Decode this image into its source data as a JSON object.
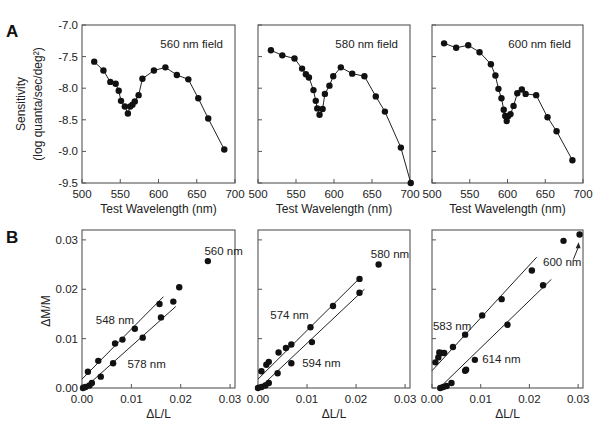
{
  "figure": {
    "panel_letters": [
      "A",
      "B"
    ],
    "row_a": {
      "ylabel_line1": "Sensitivity",
      "ylabel_line2": "(log  quanta/sec/deg²)",
      "xlabel": "Test Wavelength (nm)"
    },
    "row_b": {
      "ylabel": "ΔM/M",
      "xlabel": "ΔL/L"
    }
  },
  "chart_data": [
    {
      "type": "line",
      "panel": "A",
      "title": "560 nm field",
      "xlabel": "Test Wavelength (nm)",
      "ylabel": "Sensitivity (log quanta/sec/deg²)",
      "xlim": [
        500,
        700
      ],
      "ylim": [
        -9.5,
        -7.0
      ],
      "xticks": [
        500,
        550,
        600,
        650,
        700
      ],
      "yticks": [
        -7.0,
        -7.5,
        -8.0,
        -8.5,
        -9.0,
        -9.5
      ],
      "ytick_labels": [
        "-7.0",
        "-7.5",
        "-8.0",
        "-8.5",
        "-9.0",
        "-9.5"
      ],
      "x": [
        516,
        528,
        537,
        544,
        548,
        551,
        556,
        560,
        563,
        566,
        569,
        574,
        579,
        594,
        609,
        624,
        639,
        652,
        665,
        686
      ],
      "y": [
        -7.58,
        -7.72,
        -7.9,
        -7.93,
        -8.04,
        -8.2,
        -8.29,
        -8.4,
        -8.29,
        -8.26,
        -8.21,
        -8.11,
        -7.85,
        -7.72,
        -7.67,
        -7.79,
        -7.86,
        -8.16,
        -8.48,
        -8.97
      ]
    },
    {
      "type": "line",
      "panel": "A",
      "title": "580 nm field",
      "xlabel": "Test Wavelength (nm)",
      "xlim": [
        500,
        700
      ],
      "ylim": [
        -9.5,
        -7.0
      ],
      "xticks": [
        500,
        550,
        600,
        650,
        700
      ],
      "x": [
        517,
        532,
        548,
        558,
        563,
        567,
        573,
        576,
        578,
        581,
        585,
        588,
        594,
        599,
        609,
        624,
        640,
        655,
        667,
        688,
        701
      ],
      "y": [
        -7.4,
        -7.48,
        -7.53,
        -7.69,
        -7.78,
        -7.83,
        -8.03,
        -8.2,
        -8.32,
        -8.42,
        -8.33,
        -8.09,
        -7.96,
        -7.81,
        -7.67,
        -7.77,
        -7.81,
        -8.13,
        -8.37,
        -8.94,
        -9.5
      ]
    },
    {
      "type": "line",
      "panel": "A",
      "title": "600 nm field",
      "xlabel": "Test Wavelength (nm)",
      "xlim": [
        500,
        700
      ],
      "ylim": [
        -9.5,
        -7.0
      ],
      "xticks": [
        500,
        550,
        600,
        650,
        700
      ],
      "x": [
        516,
        532,
        548,
        563,
        578,
        584,
        588,
        592,
        595,
        597,
        599,
        601,
        604,
        608,
        613,
        619,
        624,
        638,
        653,
        665,
        686
      ],
      "y": [
        -7.29,
        -7.36,
        -7.32,
        -7.43,
        -7.62,
        -7.8,
        -8.01,
        -8.16,
        -8.34,
        -8.44,
        -8.52,
        -8.44,
        -8.41,
        -8.28,
        -8.08,
        -8.02,
        -8.09,
        -8.11,
        -8.46,
        -8.68,
        -9.14
      ]
    },
    {
      "type": "scatter",
      "panel": "B",
      "xlabel": "ΔL/L",
      "ylabel": "ΔM/M",
      "xlim": [
        0.0,
        0.031
      ],
      "ylim": [
        0.0,
        0.032
      ],
      "xticks": [
        0.0,
        0.01,
        0.02,
        0.03
      ],
      "yticks": [
        0.0,
        0.01,
        0.02,
        0.03
      ],
      "series": [
        {
          "name": "548 nm",
          "x": [
            0.0012,
            0.0033,
            0.0067,
            0.0082,
            0.0107,
            0.0157
          ],
          "y": [
            0.0033,
            0.0055,
            0.009,
            0.0098,
            0.012,
            0.017
          ],
          "fit": [
            [
              0.0,
              0.0018
            ],
            [
              0.0165,
              0.0185
            ]
          ]
        },
        {
          "name": "578 nm",
          "x": [
            0.0002,
            0.0007,
            0.0015,
            0.002,
            0.0038,
            0.0063,
            0.0123,
            0.016,
            0.0185
          ],
          "y": [
            0.0,
            0.0002,
            0.0005,
            0.001,
            0.0023,
            0.005,
            0.0102,
            0.0143,
            0.0175
          ],
          "fit": [
            [
              0.0005,
              0.0
            ],
            [
              0.019,
              0.0165
            ]
          ]
        },
        {
          "name": "560 nm",
          "x": [
            0.0197,
            0.0255
          ],
          "y": [
            0.0204,
            0.0257
          ],
          "fit": null
        }
      ],
      "annotations": [
        {
          "text": "560 nm",
          "x": 0.0248,
          "y": 0.027
        },
        {
          "text": "548 nm",
          "x": 0.0028,
          "y": 0.013
        },
        {
          "text": "578 nm",
          "x": 0.0092,
          "y": 0.004
        }
      ]
    },
    {
      "type": "scatter",
      "panel": "B",
      "xlabel": "ΔL/L",
      "xlim": [
        0.0,
        0.031
      ],
      "ylim": [
        0.0,
        0.032
      ],
      "xticks": [
        0.0,
        0.01,
        0.02,
        0.03
      ],
      "yticks": [
        0.0,
        0.01,
        0.02,
        0.03
      ],
      "series": [
        {
          "name": "574 nm",
          "x": [
            0.0007,
            0.0017,
            0.0022,
            0.0042,
            0.0057,
            0.0068,
            0.0107,
            0.0153,
            0.0207
          ],
          "y": [
            0.0034,
            0.0047,
            0.0053,
            0.0072,
            0.0081,
            0.0088,
            0.0123,
            0.0166,
            0.0221
          ],
          "fit": [
            [
              0.0,
              0.0018
            ],
            [
              0.021,
              0.0225
            ]
          ]
        },
        {
          "name": "594 nm",
          "x": [
            0.0,
            0.0007,
            0.0015,
            0.0022,
            0.004,
            0.0068,
            0.011,
            0.0207
          ],
          "y": [
            0.0,
            0.0002,
            0.0005,
            0.001,
            0.003,
            0.005,
            0.0093,
            0.0193
          ],
          "fit": [
            [
              0.0003,
              0.0
            ],
            [
              0.0217,
              0.02
            ]
          ]
        },
        {
          "name": "580 nm",
          "x": [
            0.0246
          ],
          "y": [
            0.025
          ],
          "fit": null
        }
      ],
      "annotations": [
        {
          "text": "580 nm",
          "x": 0.023,
          "y": 0.0263
        },
        {
          "text": "574 nm",
          "x": 0.0025,
          "y": 0.0139
        },
        {
          "text": "594 nm",
          "x": 0.009,
          "y": 0.0043
        }
      ]
    },
    {
      "type": "scatter",
      "panel": "B",
      "xlabel": "ΔL/L",
      "xlim": [
        0.0,
        0.031
      ],
      "ylim": [
        0.0,
        0.032
      ],
      "xticks": [
        0.0,
        0.01,
        0.02,
        0.03
      ],
      "yticks": [
        0.0,
        0.01,
        0.02,
        0.03
      ],
      "series": [
        {
          "name": "583 nm",
          "x": [
            0.0007,
            0.0013,
            0.0015,
            0.002,
            0.0025,
            0.0043,
            0.0068,
            0.0103,
            0.0143,
            0.0205
          ],
          "y": [
            0.0052,
            0.0062,
            0.0072,
            0.0071,
            0.0071,
            0.0083,
            0.0108,
            0.0147,
            0.018,
            0.0238
          ],
          "fit": [
            [
              0.0,
              0.0035
            ],
            [
              0.0215,
              0.0265
            ]
          ]
        },
        {
          "name": "614 nm",
          "x": [
            0.0017,
            0.0023,
            0.003,
            0.004,
            0.0068,
            0.007,
            0.0088,
            0.0155,
            0.0228
          ],
          "y": [
            0.0,
            0.0002,
            0.0004,
            0.001,
            0.0035,
            0.0037,
            0.0057,
            0.0128,
            0.0208
          ],
          "fit": [
            [
              0.0015,
              0.0
            ],
            [
              0.0245,
              0.022
            ]
          ]
        },
        {
          "name": "600 nm",
          "x": [
            0.027,
            0.0303
          ],
          "y": [
            0.0298,
            0.0311
          ],
          "fit": null
        }
      ],
      "annotations": [
        {
          "text": "600 nm",
          "x": 0.0228,
          "y": 0.0248
        },
        {
          "text": "583 nm",
          "x": 0.0002,
          "y": 0.0117
        },
        {
          "text": "614 nm",
          "x": 0.0103,
          "y": 0.005
        }
      ],
      "arrow": {
        "from": [
          0.029,
          0.026
        ],
        "to": [
          0.0301,
          0.0295
        ]
      }
    }
  ]
}
